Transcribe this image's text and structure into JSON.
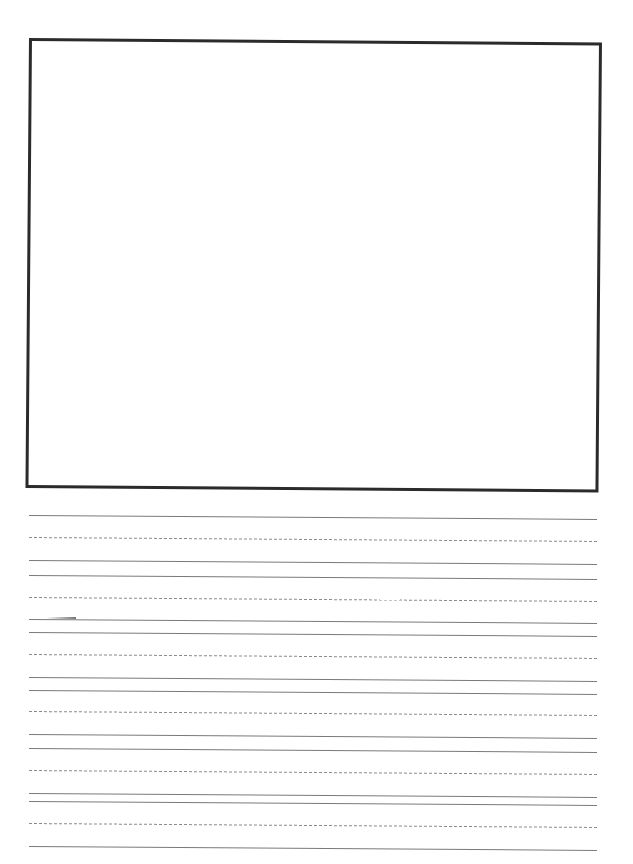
{
  "page": {
    "type": "handwriting-practice-sheet",
    "background_color": "#ffffff"
  },
  "drawing_box": {
    "label": "",
    "border_color": "#2b2b2b"
  },
  "writing_area": {
    "line_color_solid": "#7a7a7a",
    "line_color_dashed": "#8a8a8a",
    "rows": [
      {
        "top": 515,
        "midline": 537,
        "baseline": 560
      },
      {
        "top": 575,
        "midline": 597,
        "baseline": 619
      },
      {
        "top": 632,
        "midline": 654,
        "baseline": 677
      },
      {
        "top": 690,
        "midline": 711,
        "baseline": 734
      },
      {
        "top": 748,
        "midline": 770,
        "baseline": 793
      },
      {
        "top": 801,
        "midline": 823,
        "baseline": 846
      }
    ]
  }
}
